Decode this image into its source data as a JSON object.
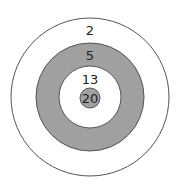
{
  "diagram": {
    "type": "target",
    "rings": [
      {
        "label": "2",
        "fill": "#ffffff"
      },
      {
        "label": "5",
        "fill": "#a0a0a0"
      },
      {
        "label": "13",
        "fill": "#ffffff"
      },
      {
        "label": "20",
        "fill": "#a0a0a0"
      }
    ],
    "stroke_color": "#555555"
  }
}
